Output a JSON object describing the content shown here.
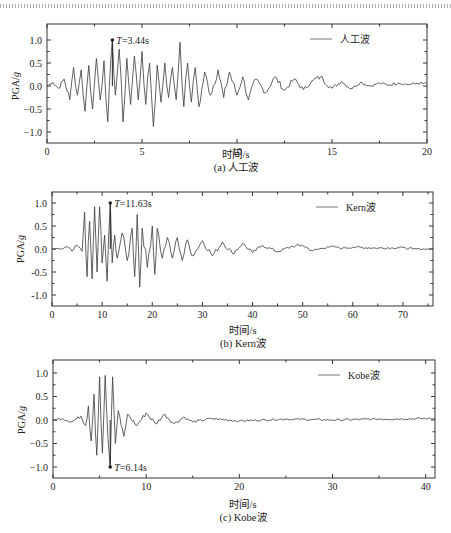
{
  "chart_data": [
    {
      "type": "line",
      "title": "(a) 人工波",
      "xlabel": "时间/s",
      "ylabel": "PGA/g",
      "xlim": [
        0,
        20
      ],
      "ylim": [
        -1.25,
        1.25
      ],
      "xticks": [
        0,
        5,
        10,
        15,
        20
      ],
      "yticks": [
        1.0,
        0.5,
        0.0,
        -0.5,
        -1.0
      ],
      "ytick_labels": [
        "1.0",
        "0.5",
        "0.0",
        "−0.5",
        "−1.0"
      ],
      "legend": [
        "人工波"
      ],
      "legend_position": "upper right",
      "grid": false,
      "annotation": {
        "text": "T=3.44s",
        "x": 3.44,
        "y": 1.0
      },
      "series": [
        {
          "name": "人工波",
          "x": [
            0,
            0.3,
            0.6,
            0.9,
            1.2,
            1.4,
            1.6,
            1.8,
            2.0,
            2.2,
            2.4,
            2.6,
            2.8,
            3.0,
            3.2,
            3.44,
            3.6,
            3.8,
            4.0,
            4.2,
            4.4,
            4.6,
            4.8,
            5.0,
            5.2,
            5.4,
            5.6,
            5.8,
            6.0,
            6.2,
            6.4,
            6.6,
            6.8,
            7.0,
            7.2,
            7.4,
            7.6,
            7.8,
            8.0,
            8.3,
            8.6,
            9.0,
            9.3,
            9.6,
            10.0,
            10.3,
            10.6,
            11.0,
            11.5,
            12.0,
            12.5,
            13.0,
            13.5,
            14.0,
            14.4,
            15.0,
            15.5,
            16.0,
            16.5,
            17.0,
            17.5,
            18.0,
            18.5,
            19.0,
            19.5,
            20.0
          ],
          "values": [
            0,
            0.08,
            -0.05,
            0.15,
            -0.3,
            0.4,
            -0.2,
            0.35,
            -0.55,
            0.45,
            -0.5,
            0.6,
            -0.3,
            0.55,
            -0.78,
            1.0,
            -0.2,
            0.8,
            -0.78,
            0.6,
            -0.4,
            0.65,
            -0.3,
            0.75,
            -0.4,
            0.5,
            -0.88,
            0.45,
            -0.35,
            0.5,
            -0.25,
            0.4,
            -0.3,
            0.95,
            -0.45,
            0.5,
            -0.35,
            0.4,
            -0.45,
            0.3,
            -0.2,
            0.35,
            -0.25,
            0.3,
            -0.2,
            0.2,
            -0.3,
            0.15,
            -0.15,
            0.2,
            -0.1,
            0.15,
            -0.08,
            0.12,
            0.2,
            -0.05,
            0.1,
            -0.06,
            0.08,
            0.0,
            0.06,
            0.02,
            0.07,
            0.03,
            0.06,
            0.05
          ]
        }
      ]
    },
    {
      "type": "line",
      "title": "(b) Kern波",
      "xlabel": "时间/s",
      "ylabel": "PGA/g",
      "xlim": [
        0,
        76
      ],
      "ylim": [
        -1.25,
        1.25
      ],
      "xticks": [
        0,
        10,
        20,
        30,
        40,
        50,
        60,
        70
      ],
      "yticks": [
        1.0,
        0.5,
        0.0,
        -0.5,
        -1.0
      ],
      "ytick_labels": [
        "1.0",
        "0.5",
        "0.0",
        "-0.5",
        "-1.0"
      ],
      "legend": [
        "Kern波"
      ],
      "legend_position": "upper right",
      "grid": false,
      "annotation": {
        "text": "T=11.63s",
        "x": 11.63,
        "y": 1.0
      },
      "series": [
        {
          "name": "Kern波",
          "x": [
            0,
            2,
            3,
            4,
            5,
            6,
            6.5,
            7,
            7.5,
            8,
            8.5,
            9,
            9.5,
            10,
            10.5,
            11,
            11.63,
            12,
            12.5,
            13,
            14,
            15,
            16,
            16.5,
            17,
            17.5,
            18,
            19,
            20,
            20.5,
            21,
            22,
            23,
            24,
            25,
            26,
            27,
            28,
            30,
            32,
            34,
            36,
            38,
            40,
            42,
            45,
            48,
            50,
            52,
            55,
            58,
            60,
            65,
            70,
            72,
            76
          ],
          "values": [
            0,
            0,
            0.05,
            -0.05,
            0.08,
            -0.05,
            0.8,
            -0.6,
            0.6,
            -0.65,
            0.92,
            -0.5,
            0.92,
            -0.3,
            0.3,
            -0.7,
            1.0,
            -0.3,
            0.3,
            -0.2,
            0.35,
            -0.25,
            0.45,
            -0.6,
            0.75,
            -0.83,
            0.45,
            -0.4,
            0.5,
            -0.55,
            0.45,
            -0.2,
            0.25,
            -0.2,
            0.25,
            -0.25,
            0.2,
            -0.15,
            0.18,
            -0.15,
            0.15,
            -0.1,
            0.12,
            -0.08,
            0.08,
            -0.06,
            0.06,
            0.08,
            -0.04,
            0.05,
            0.02,
            0.04,
            0.02,
            0.03,
            0,
            0
          ]
        }
      ]
    },
    {
      "type": "line",
      "title": "(c) Kobe波",
      "xlabel": "时间/s",
      "ylabel": "PGA/g",
      "xlim": [
        0,
        41
      ],
      "ylim": [
        -1.25,
        1.25
      ],
      "xticks": [
        0,
        10,
        20,
        30,
        40
      ],
      "yticks": [
        1.0,
        0.5,
        0.0,
        -0.5,
        -1.0
      ],
      "ytick_labels": [
        "1.0",
        "0.5",
        "0.0",
        "−0.5",
        "−1.0"
      ],
      "legend": [
        "Kobe波"
      ],
      "legend_position": "upper right",
      "grid": false,
      "annotation": {
        "text": "T=6.14s",
        "x": 6.14,
        "y": -1.0
      },
      "series": [
        {
          "name": "Kobe波",
          "x": [
            0,
            1,
            2,
            3,
            3.5,
            3.8,
            4.1,
            4.4,
            4.7,
            5.0,
            5.3,
            5.6,
            5.9,
            6.14,
            6.4,
            6.7,
            7.0,
            7.3,
            7.6,
            8,
            9,
            10,
            11,
            12,
            13,
            14,
            15,
            17,
            20,
            25,
            30,
            35,
            40,
            41
          ],
          "values": [
            0,
            0.03,
            -0.04,
            0.08,
            -0.12,
            0.3,
            -0.45,
            0.55,
            -0.75,
            0.92,
            -0.7,
            0.95,
            -0.4,
            -1.0,
            0.92,
            -0.5,
            0.2,
            -0.1,
            -0.35,
            0.12,
            -0.12,
            0.15,
            -0.08,
            0.12,
            -0.08,
            0.06,
            -0.04,
            0.03,
            -0.02,
            0.02,
            0.0,
            0.02,
            0.03,
            0.03
          ]
        }
      ]
    }
  ],
  "panels": [
    {
      "caption": "(a) 人工波",
      "xlabel": "时间/s",
      "ylabel": "PGA/g",
      "legend": "人工波",
      "annotation": "T=3.44s"
    },
    {
      "caption": "(b) Kern波",
      "xlabel": "时间/s",
      "ylabel": "PGA/g",
      "legend": "Kern波",
      "annotation": "T=11.63s"
    },
    {
      "caption": "(c) Kobe波",
      "xlabel": "时间/s",
      "ylabel": "PGA/g",
      "legend": "Kobe波",
      "annotation": "T=6.14s"
    }
  ]
}
